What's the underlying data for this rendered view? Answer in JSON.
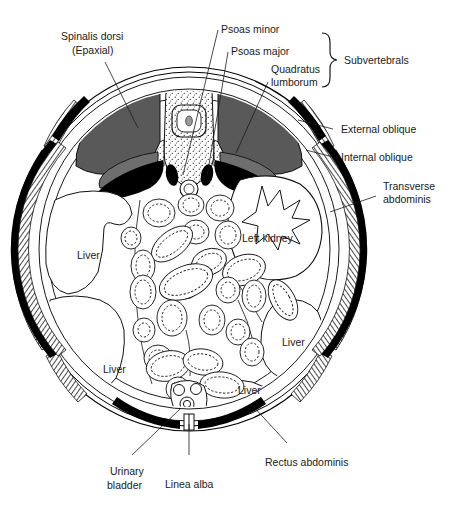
{
  "figure": {
    "colors": {
      "epaxial_muscle": "#595959",
      "subvertebral_muscle": "#000000",
      "internal_oblique": "#000000",
      "hatched_muscle": "#808080",
      "vertebra_stipple": "#8a8a8a",
      "outline": "#000000",
      "text": "#1a1a1a",
      "background": "#ffffff"
    },
    "labels": {
      "spinalis_dorsi": "Spinalis dorsi",
      "spinalis_dorsi_sub": "(Epaxial)",
      "psoas_minor": "Psoas minor",
      "psoas_major": "Psoas major",
      "quadratus_1": "Quadratus",
      "quadratus_2": "lumborum",
      "subvertebrals": "Subvertebrals",
      "external_oblique": "External oblique",
      "internal_oblique": "Internal oblique",
      "transverse_1": "Transverse",
      "transverse_2": "abdominis",
      "left_kidney": "Left kidney",
      "liver_upper_left": "Liver",
      "liver_lower_left": "Liver",
      "liver_right": "Liver",
      "liver_bottom": "Liver",
      "urinary_1": "Urinary",
      "urinary_2": "bladder",
      "linea_alba": "Linea alba",
      "rectus_abdominis": "Rectus abdominis"
    },
    "structures": [
      {
        "name": "spinalis-dorsi-left",
        "tone": "gray",
        "side": "left"
      },
      {
        "name": "spinalis-dorsi-right",
        "tone": "gray",
        "side": "right"
      },
      {
        "name": "quadratus-lumborum-left",
        "tone": "black",
        "side": "left"
      },
      {
        "name": "quadratus-lumborum-right",
        "tone": "black",
        "side": "right"
      },
      {
        "name": "psoas-major-left",
        "tone": "gray",
        "side": "left"
      },
      {
        "name": "psoas-major-right",
        "tone": "gray",
        "side": "right"
      },
      {
        "name": "psoas-minor-left",
        "tone": "black",
        "side": "left"
      },
      {
        "name": "psoas-minor-right",
        "tone": "black",
        "side": "right"
      },
      {
        "name": "vertebral-body",
        "tone": "stipple"
      },
      {
        "name": "spinal-canal",
        "tone": "stipple"
      },
      {
        "name": "aorta",
        "tone": "outline"
      },
      {
        "name": "left-kidney",
        "tone": "outline"
      },
      {
        "name": "liver-lobes",
        "tone": "outline",
        "count": 4
      },
      {
        "name": "intestinal-loops",
        "tone": "outline",
        "count": 33
      },
      {
        "name": "urinary-bladder",
        "tone": "outline"
      },
      {
        "name": "external-oblique",
        "tone": "hatched"
      },
      {
        "name": "internal-oblique",
        "tone": "black"
      },
      {
        "name": "transversus-abdominis",
        "tone": "hatched"
      },
      {
        "name": "rectus-abdominis",
        "tone": "black"
      },
      {
        "name": "linea-alba",
        "tone": "outline"
      }
    ]
  }
}
